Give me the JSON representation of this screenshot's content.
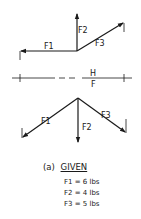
{
  "top_diagram": {
    "labels": {
      "f1": "F1",
      "f2": "F2",
      "f3": "F3"
    }
  },
  "divider": {
    "label_top": "H",
    "label_bottom": "F"
  },
  "bottom_diagram": {
    "labels": {
      "f1": "F1",
      "f2": "F2",
      "f3": "F3"
    }
  },
  "caption": {
    "prefix": "(a)",
    "title": "GIVEN",
    "values": [
      "F1 = 6 lbs",
      "F2 = 4 lbs",
      "F3 = 5 lbs"
    ]
  }
}
